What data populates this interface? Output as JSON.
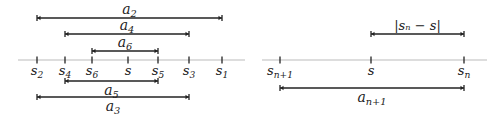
{
  "left_diagram": {
    "axis": {
      "x1": 18,
      "x2": 245,
      "y": 60,
      "color": "#bbbbbb"
    },
    "ticks": [
      {
        "x": 37,
        "base": "s",
        "sub": "2"
      },
      {
        "x": 65,
        "base": "s",
        "sub": "4"
      },
      {
        "x": 92,
        "base": "s",
        "sub": "6"
      },
      {
        "x": 128,
        "base": "s",
        "sub": ""
      },
      {
        "x": 158,
        "base": "s",
        "sub": "5"
      },
      {
        "x": 189,
        "base": "s",
        "sub": "3"
      },
      {
        "x": 222,
        "base": "s",
        "sub": "1"
      }
    ],
    "intervals": [
      {
        "x1": 37,
        "x2": 222,
        "y": 18,
        "label_base": "a",
        "label_sub": "2",
        "label_pos": "above"
      },
      {
        "x1": 65,
        "x2": 189,
        "y": 34,
        "label_base": "a",
        "label_sub": "4",
        "label_pos": "above"
      },
      {
        "x1": 92,
        "x2": 158,
        "y": 51,
        "label_base": "a",
        "label_sub": "6",
        "label_pos": "above"
      },
      {
        "x1": 65,
        "x2": 158,
        "y": 81,
        "label_base": "a",
        "label_sub": "5",
        "label_pos": "below"
      },
      {
        "x1": 37,
        "x2": 189,
        "y": 97,
        "label_base": "a",
        "label_sub": "3",
        "label_pos": "below"
      }
    ]
  },
  "right_diagram": {
    "axis": {
      "x1": 262,
      "x2": 487,
      "y": 60,
      "color": "#bbbbbb"
    },
    "ticks": [
      {
        "x": 280,
        "base": "s",
        "sub": "n+1"
      },
      {
        "x": 371,
        "base": "s",
        "sub": ""
      },
      {
        "x": 464,
        "base": "s",
        "sub": "n"
      }
    ],
    "intervals": [
      {
        "x1": 371,
        "x2": 464,
        "y": 34,
        "label": "|sₙ − s|",
        "label_pos": "above"
      },
      {
        "x1": 280,
        "x2": 464,
        "y": 88,
        "label_base": "a",
        "label_sub": "n+1",
        "label_pos": "below"
      }
    ]
  },
  "colors": {
    "line": "#222222",
    "axis": "#bbbbbb"
  }
}
